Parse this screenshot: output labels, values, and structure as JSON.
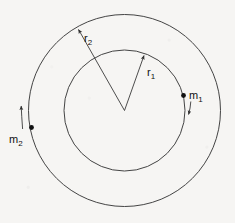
{
  "figure": {
    "background_color": "#f6f5f3",
    "line_color": "#3a3a3a",
    "label_color": "#111111",
    "center": {
      "x": 124.5,
      "y": 110.5
    },
    "circles": [
      {
        "name": "inner-orbit",
        "radius": 60.5,
        "label_ref": "r1"
      },
      {
        "name": "outer-orbit",
        "radius": 96.0,
        "label_ref": "r2"
      }
    ],
    "radius_labels": [
      {
        "id": "r1",
        "base": "r",
        "subscript": "1",
        "text": "r1",
        "label_x": 150,
        "label_y": 76,
        "arrow_from": {
          "x": 124.5,
          "y": 110.5
        },
        "arrow_to": {
          "x": 145,
          "y": 53
        }
      },
      {
        "id": "r2",
        "base": "r",
        "subscript": "2",
        "text": "r2",
        "label_x": 86,
        "label_y": 42,
        "arrow_from": {
          "x": 124.5,
          "y": 110.5
        },
        "arrow_to": {
          "x": 77,
          "y": 27
        }
      }
    ],
    "masses": [
      {
        "id": "m1",
        "base": "m",
        "subscript": "1",
        "text": "m1",
        "on_circle": "inner-orbit",
        "dot": {
          "x": 183.5,
          "y": 95.5
        },
        "label_x": 190,
        "label_y": 98,
        "direction": "clockwise",
        "velocity_arrow": {
          "from": {
            "x": 190.5,
            "y": 101
          },
          "to": {
            "x": 188,
            "y": 117
          }
        }
      },
      {
        "id": "m2",
        "base": "m",
        "subscript": "2",
        "text": "m2",
        "on_circle": "outer-orbit",
        "dot": {
          "x": 31.5,
          "y": 127.5
        },
        "label_x": 11,
        "label_y": 142,
        "direction": "counterclockwise",
        "velocity_arrow": {
          "from": {
            "x": 22.5,
            "y": 129
          },
          "to": {
            "x": 21,
            "y": 103
          }
        }
      }
    ]
  }
}
